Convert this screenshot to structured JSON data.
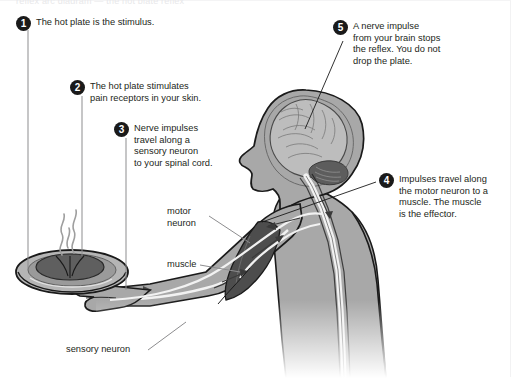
{
  "figure": {
    "title_ghost": "reflex arc diagram — the hot plate reflex",
    "domain": "biology-diagram",
    "colors": {
      "body_fill": "#a8a8a8",
      "body_outline": "#1a1a1a",
      "muscle_fill": "#4a4a4a",
      "brain_fill": "#b8b8b8",
      "nerve_white": "#f2f2f2",
      "plate_dark": "#5a5a5a",
      "bullet_bg": "#1a1a1a",
      "bullet_text": "#ffffff",
      "text": "#231f20",
      "leader_line": "#8d8d8f",
      "background": "#ffffff"
    }
  },
  "callouts": [
    {
      "number": "1",
      "text": "The hot plate is the stimulus.",
      "name": "callout-stimulus"
    },
    {
      "number": "2",
      "text": "The hot plate stimulates\npain receptors in your skin.",
      "name": "callout-pain-receptors"
    },
    {
      "number": "3",
      "text": "Nerve impulses\ntravel along a\nsensory neuron\nto your spinal cord.",
      "name": "callout-sensory-neuron"
    },
    {
      "number": "4",
      "text": "Impulses  travel along\nthe motor neuron to a\nmuscle. The muscle\nis the effector.",
      "name": "callout-motor-neuron"
    },
    {
      "number": "5",
      "text": "A nerve impulse\nfrom your brain stops\nthe reflex. You do not\ndrop the plate.",
      "name": "callout-brain-inhibition"
    }
  ],
  "labels": [
    {
      "text": "motor\nneuron",
      "name": "label-motor-neuron"
    },
    {
      "text": "muscle",
      "name": "label-muscle"
    },
    {
      "text": "sensory neuron",
      "name": "label-sensory-neuron"
    }
  ],
  "anatomy_parts": [
    "head",
    "brain",
    "cerebellum",
    "spinal-cord",
    "torso",
    "arm",
    "hand",
    "biceps-muscle",
    "plate",
    "steam"
  ]
}
